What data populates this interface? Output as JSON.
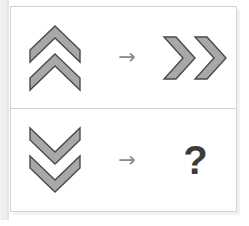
{
  "puzzle": {
    "title": "Visual analogy puzzle",
    "shape_fill": "#a8a8a8",
    "shape_stroke": "#4a4a4a",
    "arrow_color": "#8c8c8c",
    "question_color": "#3b3b3b",
    "border_color": "#d2d2d2",
    "background": "#ffffff",
    "rows": [
      {
        "id": "row-1",
        "left": {
          "icon": "double-chevron-up-icon",
          "label": "double chevron pointing up",
          "direction": "up",
          "count": 2
        },
        "operator": {
          "icon": "right-arrow-icon",
          "glyph": "→",
          "label": "maps to"
        },
        "right": {
          "icon": "double-chevron-right-icon",
          "label": "double chevron pointing right",
          "direction": "right",
          "count": 2
        }
      },
      {
        "id": "row-2",
        "left": {
          "icon": "double-chevron-down-icon",
          "label": "double chevron pointing down",
          "direction": "down",
          "count": 2
        },
        "operator": {
          "icon": "right-arrow-icon",
          "glyph": "→",
          "label": "maps to"
        },
        "right": {
          "icon": "question-mark-icon",
          "glyph": "?",
          "label": "unknown answer"
        }
      }
    ]
  }
}
